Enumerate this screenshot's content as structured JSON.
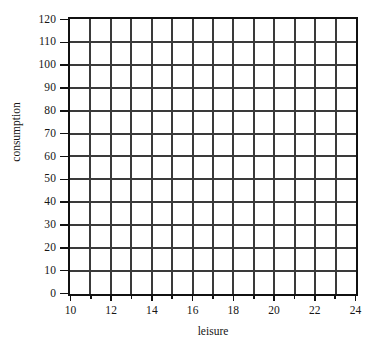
{
  "chart_data": {
    "type": "line",
    "title": "",
    "subtitle": "",
    "xlabel": "leisure",
    "ylabel": "consumption",
    "xlim": [
      10,
      24
    ],
    "ylim": [
      0,
      120
    ],
    "x_tick_labels": [
      "10",
      "12",
      "14",
      "16",
      "18",
      "20",
      "22",
      "24"
    ],
    "x_tick_values": [
      10,
      12,
      14,
      16,
      18,
      20,
      22,
      24
    ],
    "x_minor_tick_values": [
      11,
      13,
      15,
      17,
      19,
      21,
      23
    ],
    "x_grid_step": 1,
    "y_tick_labels": [
      "0",
      "10",
      "20",
      "30",
      "40",
      "50",
      "60",
      "70",
      "80",
      "90",
      "100",
      "110",
      "120"
    ],
    "y_tick_values": [
      0,
      10,
      20,
      30,
      40,
      50,
      60,
      70,
      80,
      90,
      100,
      110,
      120
    ],
    "y_grid_step": 10,
    "grid": "on",
    "grid_columns": 14,
    "grid_rows": 12,
    "legend": "none",
    "series": [],
    "values": [],
    "categories": [],
    "annotations": [],
    "colors": {
      "background": "#ffffff",
      "axis": "#111111",
      "grid": "#3a3a3a",
      "text": "#161616"
    }
  }
}
